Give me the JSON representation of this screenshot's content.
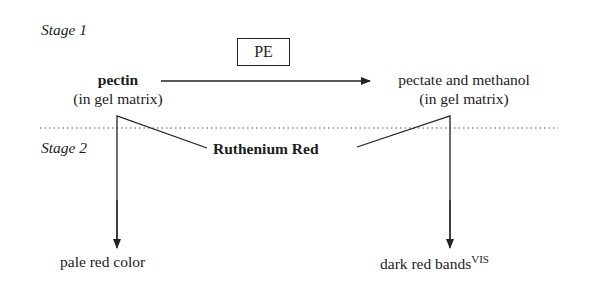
{
  "stages": {
    "stage1_label": "Stage 1",
    "stage2_label": "Stage 2"
  },
  "enzyme": {
    "label": "PE"
  },
  "reactant": {
    "name": "pectin",
    "context": "(in gel matrix)"
  },
  "product": {
    "name": "pectate and methanol",
    "context": "(in gel matrix)"
  },
  "stain": {
    "label": "Ruthenium Red"
  },
  "results": {
    "left": "pale red color",
    "right": "dark red bands",
    "right_superscript": "VIS"
  },
  "colors": {
    "ink": "#1c1c1c",
    "background": "#ffffff"
  }
}
